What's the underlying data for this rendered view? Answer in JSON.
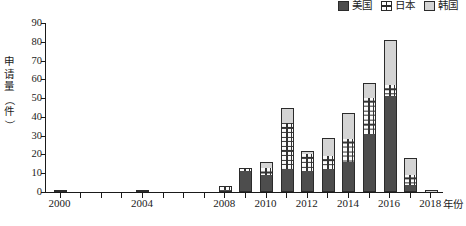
{
  "chart_data": {
    "type": "bar",
    "subtype": "stacked",
    "title": "",
    "xlabel": "年份",
    "ylabel": "申请量（件）",
    "ylabel_chars": [
      "申",
      "请",
      "量",
      "（",
      "件",
      "）"
    ],
    "categories": [
      "2000",
      "2001",
      "2002",
      "2003",
      "2004",
      "2005",
      "2006",
      "2007",
      "2008",
      "2009",
      "2010",
      "2011",
      "2012",
      "2013",
      "2014",
      "2015",
      "2016",
      "2017",
      "2018"
    ],
    "tick_labels": [
      "2000",
      "2004",
      "2008",
      "2010",
      "2012",
      "2014",
      "2016",
      "2018"
    ],
    "y_ticks": [
      0,
      10,
      20,
      30,
      40,
      50,
      60,
      70,
      80,
      90
    ],
    "ylim": [
      0,
      90
    ],
    "grid": false,
    "legend_position": "top-right",
    "series": [
      {
        "name": "美国",
        "color": "#4d4d4d",
        "values": [
          1,
          0,
          0,
          0,
          1,
          0,
          0,
          0,
          1,
          11,
          9,
          12,
          11,
          12,
          16,
          31,
          51,
          4,
          0
        ]
      },
      {
        "name": "日本",
        "color": "#ffffff",
        "pattern": "cross-hatch",
        "values": [
          0,
          0,
          0,
          0,
          0,
          0,
          0,
          0,
          2,
          1,
          4,
          25,
          9,
          7,
          12,
          19,
          6,
          5,
          0
        ]
      },
      {
        "name": "韩国",
        "color": "#d4d4d4",
        "values": [
          0,
          0,
          0,
          0,
          0,
          0,
          0,
          0,
          0,
          1,
          3,
          8,
          2,
          10,
          14,
          8,
          24,
          9,
          1
        ]
      }
    ],
    "totals": [
      1,
      0,
      0,
      0,
      1,
      0,
      0,
      0,
      3,
      13,
      16,
      45,
      22,
      29,
      42,
      58,
      81,
      18,
      1
    ]
  },
  "legend": {
    "entries": [
      {
        "label": "美国",
        "swatch": "solid-dark"
      },
      {
        "label": "日本",
        "swatch": "cross-hatch"
      },
      {
        "label": "韩国",
        "swatch": "solid-light"
      }
    ]
  },
  "axes": {
    "y_title": "申请量（件）",
    "x_title": "年份"
  }
}
